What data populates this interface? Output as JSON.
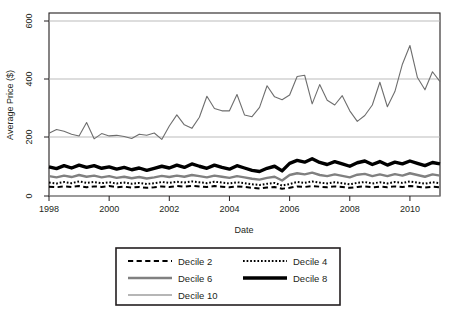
{
  "chart_data": {
    "type": "line",
    "title": "",
    "xlabel": "Date",
    "ylabel": "Average Price ($)",
    "xlim": [
      1998.0,
      2011.0
    ],
    "ylim": [
      0,
      620
    ],
    "yticks": [
      0,
      200,
      400,
      600
    ],
    "xticks": [
      1998,
      2000,
      2002,
      2004,
      2006,
      2008,
      2010
    ],
    "xtick_labels": [
      "1998",
      "2000",
      "2002",
      "2004",
      "2006",
      "2008",
      "2010"
    ],
    "ytick_labels": [
      "0",
      "200",
      "400",
      "600"
    ],
    "grid": true,
    "grid_axis": "y",
    "legend_position": "below",
    "series": [
      {
        "name": "Decile 2",
        "style": "dashed",
        "color": "#000000",
        "width": 2.0,
        "x": [
          1998.0,
          1998.25,
          1998.5,
          1998.75,
          1999.0,
          1999.25,
          1999.5,
          1999.75,
          2000.0,
          2000.25,
          2000.5,
          2000.75,
          2001.0,
          2001.25,
          2001.5,
          2001.75,
          2002.0,
          2002.25,
          2002.5,
          2002.75,
          2003.0,
          2003.25,
          2003.5,
          2003.75,
          2004.0,
          2004.25,
          2004.5,
          2004.75,
          2005.0,
          2005.25,
          2005.5,
          2005.75,
          2006.0,
          2006.25,
          2006.5,
          2006.75,
          2007.0,
          2007.25,
          2007.5,
          2007.75,
          2008.0,
          2008.25,
          2008.5,
          2008.75,
          2009.0,
          2009.25,
          2009.5,
          2009.75,
          2010.0,
          2010.25,
          2010.5,
          2010.75,
          2011.0
        ],
        "values": [
          32,
          30,
          33,
          31,
          34,
          30,
          33,
          31,
          34,
          30,
          32,
          29,
          31,
          28,
          30,
          33,
          31,
          34,
          32,
          35,
          33,
          31,
          34,
          32,
          30,
          33,
          31,
          28,
          26,
          29,
          31,
          25,
          28,
          33,
          31,
          34,
          32,
          30,
          33,
          31,
          28,
          31,
          33,
          30,
          32,
          30,
          33,
          31,
          34,
          32,
          29,
          32,
          30
        ]
      },
      {
        "name": "Decile 4",
        "style": "dotted",
        "color": "#000000",
        "width": 2.0,
        "x": [
          1998.0,
          1998.25,
          1998.5,
          1998.75,
          1999.0,
          1999.25,
          1999.5,
          1999.75,
          2000.0,
          2000.25,
          2000.5,
          2000.75,
          2001.0,
          2001.25,
          2001.5,
          2001.75,
          2002.0,
          2002.25,
          2002.5,
          2002.75,
          2003.0,
          2003.25,
          2003.5,
          2003.75,
          2004.0,
          2004.25,
          2004.5,
          2004.75,
          2005.0,
          2005.25,
          2005.5,
          2005.75,
          2006.0,
          2006.25,
          2006.5,
          2006.75,
          2007.0,
          2007.25,
          2007.5,
          2007.75,
          2008.0,
          2008.25,
          2008.5,
          2008.75,
          2009.0,
          2009.25,
          2009.5,
          2009.75,
          2010.0,
          2010.25,
          2010.5,
          2010.75,
          2011.0
        ],
        "values": [
          46,
          43,
          48,
          44,
          50,
          45,
          48,
          44,
          47,
          43,
          46,
          42,
          45,
          41,
          44,
          48,
          45,
          49,
          46,
          50,
          47,
          44,
          49,
          46,
          43,
          47,
          44,
          40,
          38,
          42,
          45,
          36,
          41,
          48,
          45,
          50,
          46,
          43,
          47,
          44,
          40,
          45,
          48,
          43,
          47,
          43,
          48,
          45,
          50,
          46,
          42,
          47,
          44
        ]
      },
      {
        "name": "Decile 6",
        "style": "solid",
        "color": "#808080",
        "width": 2.4,
        "x": [
          1998.0,
          1998.25,
          1998.5,
          1998.75,
          1999.0,
          1999.25,
          1999.5,
          1999.75,
          2000.0,
          2000.25,
          2000.5,
          2000.75,
          2001.0,
          2001.25,
          2001.5,
          2001.75,
          2002.0,
          2002.25,
          2002.5,
          2002.75,
          2003.0,
          2003.25,
          2003.5,
          2003.75,
          2004.0,
          2004.25,
          2004.5,
          2004.75,
          2005.0,
          2005.25,
          2005.5,
          2005.75,
          2006.0,
          2006.25,
          2006.5,
          2006.75,
          2007.0,
          2007.25,
          2007.5,
          2007.75,
          2008.0,
          2008.25,
          2008.5,
          2008.75,
          2009.0,
          2009.25,
          2009.5,
          2009.75,
          2010.0,
          2010.25,
          2010.5,
          2010.75,
          2011.0
        ],
        "values": [
          68,
          64,
          70,
          65,
          72,
          66,
          70,
          64,
          68,
          62,
          66,
          61,
          65,
          60,
          64,
          69,
          65,
          70,
          66,
          72,
          68,
          64,
          70,
          66,
          62,
          68,
          64,
          59,
          56,
          62,
          66,
          53,
          72,
          78,
          74,
          80,
          72,
          68,
          74,
          69,
          64,
          73,
          76,
          68,
          74,
          68,
          75,
          70,
          78,
          72,
          66,
          74,
          70
        ]
      },
      {
        "name": "Decile 8",
        "style": "solid",
        "color": "#000000",
        "width": 3.4,
        "x": [
          1998.0,
          1998.25,
          1998.5,
          1998.75,
          1999.0,
          1999.25,
          1999.5,
          1999.75,
          2000.0,
          2000.25,
          2000.5,
          2000.75,
          2001.0,
          2001.25,
          2001.5,
          2001.75,
          2002.0,
          2002.25,
          2002.5,
          2002.75,
          2003.0,
          2003.25,
          2003.5,
          2003.75,
          2004.0,
          2004.25,
          2004.5,
          2004.75,
          2005.0,
          2005.25,
          2005.5,
          2005.75,
          2006.0,
          2006.25,
          2006.5,
          2006.75,
          2007.0,
          2007.25,
          2007.5,
          2007.75,
          2008.0,
          2008.25,
          2008.5,
          2008.75,
          2009.0,
          2009.25,
          2009.5,
          2009.75,
          2010.0,
          2010.25,
          2010.5,
          2010.75,
          2011.0
        ],
        "values": [
          100,
          94,
          104,
          96,
          106,
          98,
          104,
          95,
          100,
          92,
          98,
          90,
          96,
          88,
          95,
          102,
          96,
          106,
          98,
          110,
          102,
          95,
          106,
          98,
          92,
          104,
          96,
          88,
          84,
          95,
          102,
          86,
          112,
          122,
          116,
          128,
          115,
          108,
          118,
          110,
          102,
          114,
          120,
          108,
          118,
          106,
          116,
          110,
          120,
          112,
          104,
          115,
          110
        ]
      },
      {
        "name": "Decile 10",
        "style": "solid",
        "color": "#6e6e6e",
        "width": 1.1,
        "x": [
          1998.0,
          1998.25,
          1998.5,
          1998.75,
          1999.0,
          1999.25,
          1999.5,
          1999.75,
          2000.0,
          2000.25,
          2000.5,
          2000.75,
          2001.0,
          2001.25,
          2001.5,
          2001.75,
          2002.0,
          2002.25,
          2002.5,
          2002.75,
          2003.0,
          2003.25,
          2003.5,
          2003.75,
          2004.0,
          2004.25,
          2004.5,
          2004.75,
          2005.0,
          2005.25,
          2005.5,
          2005.75,
          2006.0,
          2006.25,
          2006.5,
          2006.75,
          2007.0,
          2007.25,
          2007.5,
          2007.75,
          2008.0,
          2008.25,
          2008.5,
          2008.75,
          2009.0,
          2009.25,
          2009.5,
          2009.75,
          2010.0,
          2010.25,
          2010.5,
          2010.75,
          2011.0
        ],
        "values": [
          215,
          228,
          222,
          212,
          206,
          252,
          196,
          214,
          206,
          208,
          204,
          197,
          212,
          208,
          216,
          194,
          240,
          278,
          244,
          232,
          270,
          342,
          300,
          292,
          292,
          348,
          278,
          272,
          304,
          378,
          340,
          330,
          346,
          410,
          414,
          316,
          382,
          328,
          312,
          344,
          292,
          256,
          276,
          312,
          390,
          306,
          358,
          452,
          516,
          406,
          364,
          426,
          392
        ]
      }
    ],
    "legend_entries": [
      {
        "label": "Decile 2",
        "style": "dashed",
        "color": "#000000",
        "width": 2.0
      },
      {
        "label": "Decile 4",
        "style": "dotted",
        "color": "#000000",
        "width": 2.0
      },
      {
        "label": "Decile 6",
        "style": "solid",
        "color": "#808080",
        "width": 2.4
      },
      {
        "label": "Decile 8",
        "style": "solid",
        "color": "#000000",
        "width": 3.4
      },
      {
        "label": "Decile 10",
        "style": "solid",
        "color": "#6e6e6e",
        "width": 1.1
      }
    ]
  },
  "colors": {
    "frame": "#231f20",
    "grid": "#b3b3b3",
    "text": "#231f20",
    "background": "#ffffff"
  }
}
